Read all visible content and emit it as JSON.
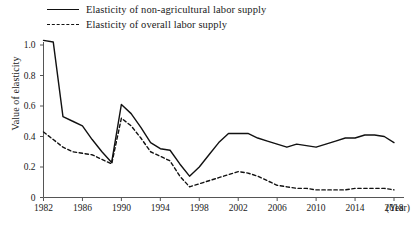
{
  "legend": {
    "position": "top-left",
    "entries": [
      {
        "label": "Elasticity of non-agricultural labor supply",
        "style": "solid",
        "swatch": "solid-line-swatch"
      },
      {
        "label": "Elasticity of overall labor supply",
        "style": "dashed",
        "swatch": "dashed-line-swatch"
      }
    ]
  },
  "axes": {
    "ylabel": "Value of elasticity",
    "xunit": "(Year)",
    "yticks": [
      "0",
      "0.2",
      "0.4",
      "0.6",
      "0.8",
      "1.0"
    ],
    "xticks": [
      "1982",
      "1986",
      "1990",
      "1994",
      "1998",
      "2002",
      "2006",
      "2010",
      "2014",
      "2018"
    ]
  },
  "colors": {
    "line": "#111111",
    "axis": "#555555",
    "background": "#ffffff"
  },
  "chart_data": {
    "type": "line",
    "title": "",
    "xlabel": "(Year)",
    "ylabel": "Value of elasticity",
    "xlim": [
      1982,
      2018
    ],
    "ylim": [
      0,
      1.05
    ],
    "grid": false,
    "legend_position": "top-left",
    "x": [
      1982,
      1983,
      1984,
      1985,
      1986,
      1987,
      1988,
      1989,
      1990,
      1991,
      1992,
      1993,
      1994,
      1995,
      1996,
      1997,
      1998,
      1999,
      2000,
      2001,
      2002,
      2003,
      2004,
      2005,
      2006,
      2007,
      2008,
      2009,
      2010,
      2011,
      2012,
      2013,
      2014,
      2015,
      2016,
      2017,
      2018
    ],
    "series": [
      {
        "name": "Elasticity of non-agricultural labor supply",
        "style": "solid",
        "values": [
          1.03,
          1.02,
          0.53,
          0.5,
          0.47,
          0.38,
          0.3,
          0.23,
          0.61,
          0.55,
          0.46,
          0.36,
          0.32,
          0.31,
          0.22,
          0.14,
          0.2,
          0.28,
          0.36,
          0.42,
          0.42,
          0.42,
          0.39,
          0.37,
          0.35,
          0.33,
          0.35,
          0.34,
          0.33,
          0.35,
          0.37,
          0.39,
          0.39,
          0.41,
          0.41,
          0.4,
          0.36
        ]
      },
      {
        "name": "Elasticity of overall labor supply",
        "style": "dashed",
        "values": [
          0.43,
          0.38,
          0.33,
          0.3,
          0.29,
          0.28,
          0.25,
          0.22,
          0.52,
          0.47,
          0.39,
          0.3,
          0.27,
          0.24,
          0.14,
          0.07,
          0.09,
          0.11,
          0.13,
          0.15,
          0.17,
          0.16,
          0.14,
          0.11,
          0.08,
          0.07,
          0.06,
          0.06,
          0.05,
          0.05,
          0.05,
          0.05,
          0.06,
          0.06,
          0.06,
          0.06,
          0.05
        ]
      }
    ]
  }
}
